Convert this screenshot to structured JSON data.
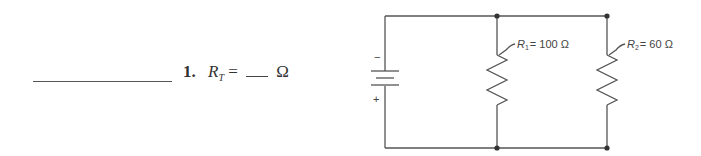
{
  "question": {
    "number": "1.",
    "variable": "R",
    "subscript": "T",
    "equals": "=",
    "unit": "Ω"
  },
  "circuit": {
    "battery": {
      "negative_label": "−",
      "positive_label": "+"
    },
    "resistors": [
      {
        "name": "R",
        "subscript": "1",
        "label_suffix": "= 100 Ω",
        "resistance_ohms": 100
      },
      {
        "name": "R",
        "subscript": "2",
        "label_suffix": "= 60 Ω",
        "resistance_ohms": 60
      }
    ],
    "topology": "parallel"
  }
}
